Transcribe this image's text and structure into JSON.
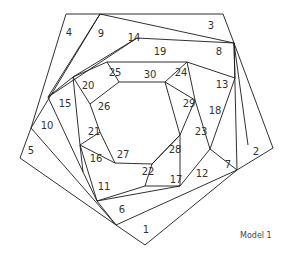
{
  "diagram": {
    "caption": "Model 1",
    "line_color": "#1a1a1a",
    "label_color": "#333333",
    "segments": [
      [
        66,
        14,
        223,
        14
      ],
      [
        223,
        14,
        234,
        43
      ],
      [
        234,
        43,
        273,
        148
      ],
      [
        273,
        148,
        237,
        170
      ],
      [
        237,
        170,
        145,
        245
      ],
      [
        145,
        245,
        116,
        225
      ],
      [
        116,
        225,
        20,
        158
      ],
      [
        20,
        158,
        31,
        128
      ],
      [
        31,
        128,
        66,
        14
      ],
      [
        100,
        14,
        31,
        128
      ],
      [
        100,
        14,
        234,
        43
      ],
      [
        234,
        43,
        237,
        170
      ],
      [
        237,
        170,
        116,
        225
      ],
      [
        116,
        225,
        31,
        128
      ],
      [
        100,
        14,
        48,
        97
      ],
      [
        137,
        38,
        48,
        97
      ],
      [
        137,
        38,
        234,
        43
      ],
      [
        234,
        43,
        248,
        145
      ],
      [
        234,
        43,
        235,
        78
      ],
      [
        235,
        78,
        210,
        149
      ],
      [
        210,
        149,
        180,
        186
      ],
      [
        210,
        149,
        237,
        170
      ],
      [
        116,
        225,
        97,
        201
      ],
      [
        97,
        201,
        180,
        186
      ],
      [
        180,
        186,
        145,
        186
      ],
      [
        97,
        201,
        83,
        172
      ],
      [
        83,
        172,
        48,
        97
      ],
      [
        48,
        97,
        73,
        77
      ],
      [
        73,
        77,
        80,
        145
      ],
      [
        83,
        172,
        80,
        145
      ],
      [
        137,
        38,
        73,
        77
      ],
      [
        73,
        77,
        107,
        62
      ],
      [
        107,
        62,
        187,
        62
      ],
      [
        187,
        62,
        235,
        78
      ],
      [
        187,
        62,
        195,
        100
      ],
      [
        195,
        100,
        210,
        149
      ],
      [
        195,
        100,
        180,
        135
      ],
      [
        180,
        135,
        180,
        186
      ],
      [
        180,
        135,
        152,
        164
      ],
      [
        152,
        164,
        145,
        186
      ],
      [
        152,
        164,
        115,
        163
      ],
      [
        115,
        163,
        80,
        145
      ],
      [
        115,
        163,
        100,
        132
      ],
      [
        100,
        132,
        80,
        145
      ],
      [
        100,
        132,
        90,
        104
      ],
      [
        90,
        104,
        73,
        77
      ],
      [
        90,
        104,
        119,
        82
      ],
      [
        119,
        82,
        107,
        62
      ],
      [
        119,
        82,
        165,
        82
      ],
      [
        165,
        82,
        187,
        62
      ],
      [
        165,
        82,
        195,
        100
      ],
      [
        165,
        82,
        180,
        135
      ],
      [
        152,
        164,
        180,
        135
      ],
      [
        80,
        145,
        97,
        201
      ],
      [
        145,
        186,
        97,
        201
      ]
    ],
    "labels": [
      {
        "n": "1",
        "x": 146,
        "y": 230
      },
      {
        "n": "2",
        "x": 256,
        "y": 152
      },
      {
        "n": "3",
        "x": 211,
        "y": 26
      },
      {
        "n": "4",
        "x": 69,
        "y": 33
      },
      {
        "n": "5",
        "x": 31,
        "y": 151
      },
      {
        "n": "6",
        "x": 122,
        "y": 210
      },
      {
        "n": "7",
        "x": 228,
        "y": 165
      },
      {
        "n": "8",
        "x": 219,
        "y": 52
      },
      {
        "n": "9",
        "x": 101,
        "y": 34
      },
      {
        "n": "10",
        "x": 47,
        "y": 126
      },
      {
        "n": "11",
        "x": 104,
        "y": 187
      },
      {
        "n": "12",
        "x": 202,
        "y": 174
      },
      {
        "n": "13",
        "x": 222,
        "y": 85
      },
      {
        "n": "14",
        "x": 134,
        "y": 38
      },
      {
        "n": "15",
        "x": 65,
        "y": 104
      },
      {
        "n": "16",
        "x": 96,
        "y": 159
      },
      {
        "n": "17",
        "x": 176,
        "y": 180
      },
      {
        "n": "18",
        "x": 215,
        "y": 111
      },
      {
        "n": "19",
        "x": 160,
        "y": 52
      },
      {
        "n": "20",
        "x": 88,
        "y": 86
      },
      {
        "n": "21",
        "x": 94,
        "y": 132
      },
      {
        "n": "22",
        "x": 148,
        "y": 172
      },
      {
        "n": "23",
        "x": 201,
        "y": 132
      },
      {
        "n": "24",
        "x": 181,
        "y": 73
      },
      {
        "n": "25",
        "x": 115,
        "y": 73
      },
      {
        "n": "26",
        "x": 104,
        "y": 107
      },
      {
        "n": "27",
        "x": 123,
        "y": 155
      },
      {
        "n": "28",
        "x": 175,
        "y": 150
      },
      {
        "n": "29",
        "x": 189,
        "y": 104
      },
      {
        "n": "30",
        "x": 150,
        "y": 75
      }
    ]
  }
}
